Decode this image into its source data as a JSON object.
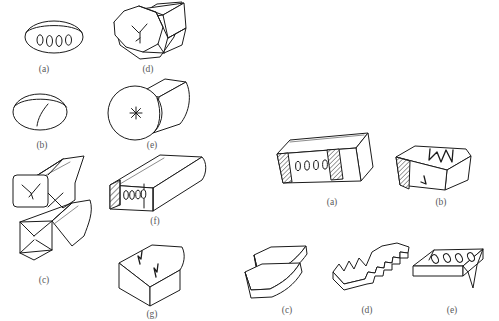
{
  "figure": {
    "background_color": "#ffffff",
    "line_color": "#1b1b1b",
    "label_color": "#58595b",
    "groups": [
      {
        "group_id": "left-group",
        "caption_labels": [
          "(a)",
          "(b)",
          "(c)",
          "(d)",
          "(e)",
          "(f)",
          "(g)"
        ],
        "items": [
          {
            "label": "(a)",
            "shape": "round-bar-end-face",
            "defect": "row of elongated voids / porosity on end face",
            "void_count": 4,
            "hatched": false
          },
          {
            "label": "(b)",
            "shape": "round-bar-end-face",
            "defect": "single curved crack line on end face",
            "void_count": 0,
            "hatched": false
          },
          {
            "label": "(c)",
            "shape": "two-square-bars",
            "defect": "X-shaped crack on end faces of both bars",
            "void_count": 0,
            "hatched": false
          },
          {
            "label": "(d)",
            "shape": "octagonal-bar",
            "defect": "branched star crack on end face",
            "void_count": 0,
            "hatched": false
          },
          {
            "label": "(e)",
            "shape": "cylindrical-bar",
            "defect": "radial burst / star crack at centre of end face",
            "void_count": 0,
            "hatched": false
          },
          {
            "label": "(f)",
            "shape": "rectangular-bar-cut",
            "defect": "internal voids revealed on hatched cut section",
            "void_count": 4,
            "hatched": true
          },
          {
            "label": "(g)",
            "shape": "rectangular-block",
            "defect": "zigzag surface crack on top face",
            "void_count": 0,
            "hatched": false
          }
        ]
      },
      {
        "group_id": "right-group",
        "caption_labels": [
          "(a)",
          "(b)",
          "(c)",
          "(d)",
          "(e)"
        ],
        "items": [
          {
            "label": "(a)",
            "shape": "rectangular-bar-two-cuts",
            "defect": "internal voids between two hatched cut sections",
            "void_count": 4,
            "hatched": true
          },
          {
            "label": "(b)",
            "shape": "rectangular-bar-cut",
            "defect": "jagged zigzag fracture across top face",
            "void_count": 0,
            "hatched": true
          },
          {
            "label": "(c)",
            "shape": "split-plate",
            "defect": "delamination / lamination splitting into layers",
            "void_count": 0,
            "hatched": false
          },
          {
            "label": "(d)",
            "shape": "flat-plate",
            "defect": "serrated sawtooth edge fracture",
            "void_count": 0,
            "hatched": false
          },
          {
            "label": "(e)",
            "shape": "flat-plate-bent-edge",
            "defect": "row of elongated voids on plate surface",
            "void_count": 4,
            "hatched": false
          }
        ]
      }
    ]
  }
}
